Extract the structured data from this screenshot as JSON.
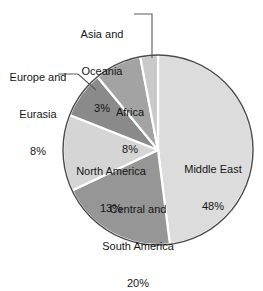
{
  "chart_data": {
    "type": "pie",
    "title": "",
    "subtitle": "",
    "xlabel": "",
    "ylabel": "",
    "legend_position": "none",
    "grid": false,
    "total": 100,
    "units": "%",
    "categories": [
      "Middle East",
      "Central and South America",
      "North America",
      "Europe and Eurasia",
      "Africa",
      "Asia and Oceania"
    ],
    "values": [
      48,
      20,
      13,
      8,
      8,
      3
    ],
    "slices": [
      {
        "label": "Middle East",
        "label_line1": "Middle East",
        "value": 48,
        "value_text": "48%",
        "color": "#dcdcdc",
        "label_placement": "inside"
      },
      {
        "label": "Central and South America",
        "label_line1": "Central and",
        "label_line2": "South America",
        "value": 20,
        "value_text": "20%",
        "color": "#969696",
        "label_placement": "inside"
      },
      {
        "label": "North America",
        "label_line1": "North America",
        "value": 13,
        "value_text": "13%",
        "color": "#d5d5d5",
        "label_placement": "inside"
      },
      {
        "label": "Europe and Eurasia",
        "label_line1": "Europe and",
        "label_line2": "Eurasia",
        "value": 8,
        "value_text": "8%",
        "color": "#8a8a8a",
        "label_placement": "callout-left"
      },
      {
        "label": "Africa",
        "label_line1": "Africa",
        "value": 8,
        "value_text": "8%",
        "color": "#a3a3a3",
        "label_placement": "inside"
      },
      {
        "label": "Asia and Oceania",
        "label_line1": "Asia and",
        "label_line2": "Oceania",
        "value": 3,
        "value_text": "3%",
        "color": "#c9c9c9",
        "label_placement": "callout-top"
      }
    ],
    "style": {
      "background": "#ffffff",
      "outline_color": "#4a4a4a",
      "separator_color": "#ffffff",
      "text_color": "#151515",
      "center_x": 158,
      "center_y": 150,
      "radius": 95,
      "start_angle_deg": -90,
      "direction": "clockwise"
    }
  }
}
